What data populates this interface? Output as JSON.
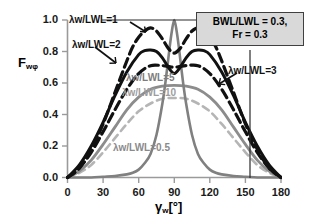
{
  "chart_data": {
    "type": "line",
    "title": "",
    "xlabel": "γw[°]",
    "ylabel": "Fwφ",
    "xlim": [
      0,
      180
    ],
    "ylim": [
      0,
      1.0
    ],
    "xticks": [
      "0",
      "30",
      "60",
      "90",
      "120",
      "150",
      "180"
    ],
    "yticks": [
      "0.0",
      "0.2",
      "0.4",
      "0.6",
      "0.8",
      "1.0"
    ],
    "grid": false,
    "legend_position": "inline-annotations",
    "annotations": [
      "λw/LWL=1",
      "λw/LWL=2",
      "λw/LWL=3",
      "λw/LWL=5",
      "λw/LWL=10",
      "λw/LWL=0.5"
    ],
    "series": [
      {
        "name": "λw/LWL=0.5",
        "label": "λw/LWL=0.5",
        "color": "#808080",
        "style": "solid",
        "x": [
          0,
          10,
          20,
          30,
          40,
          50,
          55,
          60,
          65,
          70,
          75,
          80,
          83,
          86,
          88,
          90,
          92,
          94,
          97,
          100,
          105,
          110,
          115,
          120,
          125,
          130,
          140,
          150,
          160,
          170,
          180
        ],
        "y": [
          0.0,
          0.0,
          0.0,
          0.005,
          0.01,
          0.02,
          0.03,
          0.05,
          0.09,
          0.15,
          0.27,
          0.47,
          0.63,
          0.82,
          0.93,
          1.0,
          0.93,
          0.82,
          0.63,
          0.47,
          0.27,
          0.15,
          0.09,
          0.05,
          0.03,
          0.02,
          0.01,
          0.005,
          0.0,
          0.0,
          0.0
        ]
      },
      {
        "name": "λw/LWL=1",
        "label": "λw/LWL=1",
        "color": "#111111",
        "style": "dashed",
        "x": [
          0,
          10,
          20,
          30,
          40,
          50,
          55,
          60,
          65,
          70,
          75,
          80,
          85,
          90,
          95,
          100,
          105,
          110,
          115,
          120,
          125,
          130,
          140,
          150,
          160,
          170,
          180
        ],
        "y": [
          0.0,
          0.06,
          0.18,
          0.34,
          0.54,
          0.74,
          0.83,
          0.89,
          0.93,
          0.95,
          0.93,
          0.88,
          0.82,
          0.79,
          0.82,
          0.88,
          0.93,
          0.95,
          0.93,
          0.89,
          0.83,
          0.74,
          0.54,
          0.34,
          0.18,
          0.06,
          0.0
        ]
      },
      {
        "name": "λw/LWL=2",
        "label": "λw/LWL=2",
        "color": "#111111",
        "style": "solid",
        "x": [
          0,
          10,
          20,
          30,
          40,
          50,
          60,
          65,
          70,
          75,
          80,
          85,
          90,
          95,
          100,
          105,
          110,
          115,
          120,
          130,
          140,
          150,
          160,
          170,
          180
        ],
        "y": [
          0.0,
          0.08,
          0.2,
          0.35,
          0.52,
          0.67,
          0.78,
          0.805,
          0.81,
          0.8,
          0.76,
          0.7,
          0.66,
          0.7,
          0.76,
          0.8,
          0.81,
          0.805,
          0.78,
          0.67,
          0.52,
          0.35,
          0.2,
          0.08,
          0.0
        ]
      },
      {
        "name": "λw/LWL=3",
        "label": "λw/LWL=3",
        "color": "#111111",
        "style": "dashed",
        "x": [
          0,
          10,
          20,
          30,
          40,
          50,
          60,
          70,
          80,
          85,
          90,
          95,
          100,
          110,
          120,
          130,
          140,
          150,
          160,
          170,
          180
        ],
        "y": [
          0.0,
          0.06,
          0.16,
          0.29,
          0.43,
          0.56,
          0.66,
          0.71,
          0.71,
          0.705,
          0.7,
          0.705,
          0.71,
          0.71,
          0.66,
          0.56,
          0.43,
          0.29,
          0.16,
          0.06,
          0.0
        ]
      },
      {
        "name": "λw/LWL=5",
        "label": "λw/LWL=5",
        "color": "#8c8c8c",
        "style": "solid",
        "x": [
          0,
          10,
          20,
          30,
          40,
          50,
          60,
          70,
          80,
          90,
          100,
          110,
          120,
          130,
          140,
          150,
          160,
          170,
          180
        ],
        "y": [
          0.0,
          0.04,
          0.11,
          0.21,
          0.32,
          0.43,
          0.51,
          0.56,
          0.58,
          0.585,
          0.58,
          0.56,
          0.51,
          0.43,
          0.32,
          0.21,
          0.11,
          0.04,
          0.0
        ]
      },
      {
        "name": "λw/LWL=10",
        "label": "λw/LWL=10",
        "color": "#b5b5b5",
        "style": "dashed",
        "x": [
          0,
          10,
          20,
          30,
          40,
          50,
          60,
          70,
          80,
          90,
          100,
          110,
          120,
          130,
          140,
          150,
          160,
          170,
          180
        ],
        "y": [
          0.0,
          0.03,
          0.08,
          0.16,
          0.25,
          0.34,
          0.42,
          0.47,
          0.5,
          0.505,
          0.5,
          0.47,
          0.42,
          0.34,
          0.25,
          0.16,
          0.08,
          0.03,
          0.0
        ]
      }
    ]
  },
  "info_box": {
    "line1": "BWL/LWL = 0.3,",
    "line2": "Fr = 0.3"
  },
  "labels": {
    "y_axis_main": "F",
    "y_axis_sub": "wφ",
    "x_axis_main": "γ",
    "x_axis_sub": "w",
    "x_axis_unit": "[°]"
  }
}
